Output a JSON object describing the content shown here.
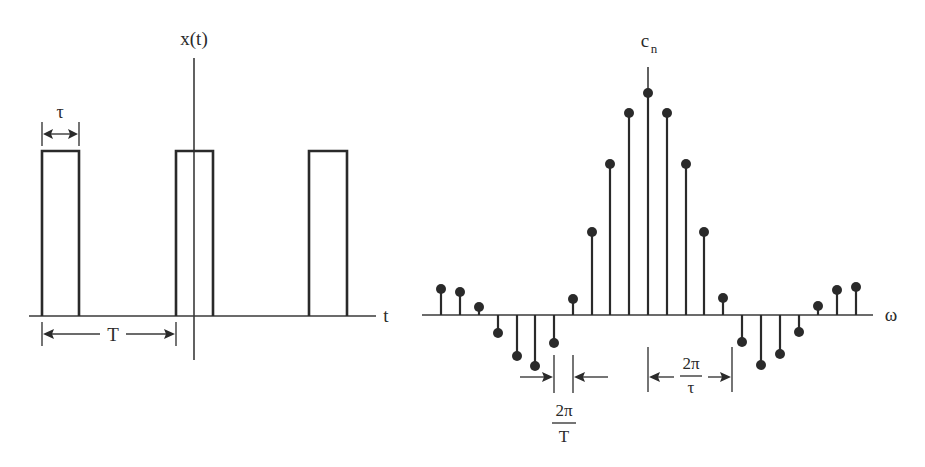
{
  "figure": {
    "left_panel": {
      "title": "Periodic rectangular pulse train",
      "y_axis_label": "x(t)",
      "x_axis_label": "t",
      "pulse_width_label": "τ",
      "period_label": "T",
      "pulses": [
        {
          "x_start": 42,
          "x_end": 79
        },
        {
          "x_start": 176,
          "x_end": 213
        },
        {
          "x_start": 309,
          "x_end": 347
        }
      ],
      "pulse_top_y": 151,
      "axis": {
        "x_start": 29,
        "x_end": 376,
        "y": 316,
        "v_x": 194,
        "v_y_start": 58,
        "v_y_end": 360
      }
    },
    "right_panel": {
      "title": "Fourier series coefficients (sinc envelope)",
      "y_axis_label_main": "c",
      "y_axis_label_sub": "n",
      "x_axis_label": "ω",
      "spacing_label_num": "2π",
      "spacing_label_den": "T",
      "null_width_label_num": "2π",
      "null_width_label_den": "τ",
      "axis": {
        "x_start": 422,
        "x_end": 873,
        "y": 315,
        "v_x": 648,
        "v_y_start": 67
      }
    }
  },
  "chart_data": {
    "type": "stem",
    "title": "",
    "xlabel": "ω",
    "ylabel": "c_n",
    "n": [
      -11,
      -10,
      -9,
      -8,
      -7,
      -6,
      -5,
      -4,
      -3,
      -2,
      -1,
      0,
      1,
      2,
      3,
      4,
      5,
      6,
      7,
      8,
      9,
      10,
      11
    ],
    "stem_x_px": [
      441,
      460,
      479,
      498,
      517,
      535,
      554,
      573,
      592,
      610,
      629,
      648,
      667,
      686,
      704,
      723,
      742,
      761,
      780,
      799,
      818,
      837,
      856
    ],
    "dot_y_px": [
      289,
      292,
      307,
      333,
      356,
      366,
      343,
      299,
      232,
      164,
      113,
      93,
      113,
      164,
      232,
      298,
      342,
      365,
      354,
      332,
      306,
      290,
      287
    ],
    "relative_values": [
      0.12,
      0.1,
      0.04,
      -0.08,
      -0.18,
      -0.23,
      -0.13,
      0.07,
      0.37,
      0.68,
      0.91,
      1.0,
      0.91,
      0.68,
      0.37,
      0.08,
      -0.12,
      -0.22,
      -0.17,
      -0.08,
      0.04,
      0.11,
      0.13
    ],
    "annotations": [
      "2π/T (line spacing)",
      "2π/τ (first zero crossing width)"
    ],
    "grid": false,
    "legend": null
  }
}
